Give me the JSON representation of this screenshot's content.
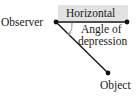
{
  "diagram": {
    "type": "angle-of-depression",
    "labels": {
      "observer": "Observer",
      "horizontal": "Horizontal",
      "angle_line1": "Angle of",
      "angle_line2": "depression",
      "object": "Object"
    },
    "colors": {
      "line": "#111111",
      "highlight_box": "#e2e2e2",
      "text": "#1a1a1a",
      "arc": "#888888"
    },
    "points": {
      "observer": [
        56,
        22
      ],
      "horizontal_end": [
        127,
        22
      ],
      "object": [
        108,
        73
      ]
    }
  }
}
